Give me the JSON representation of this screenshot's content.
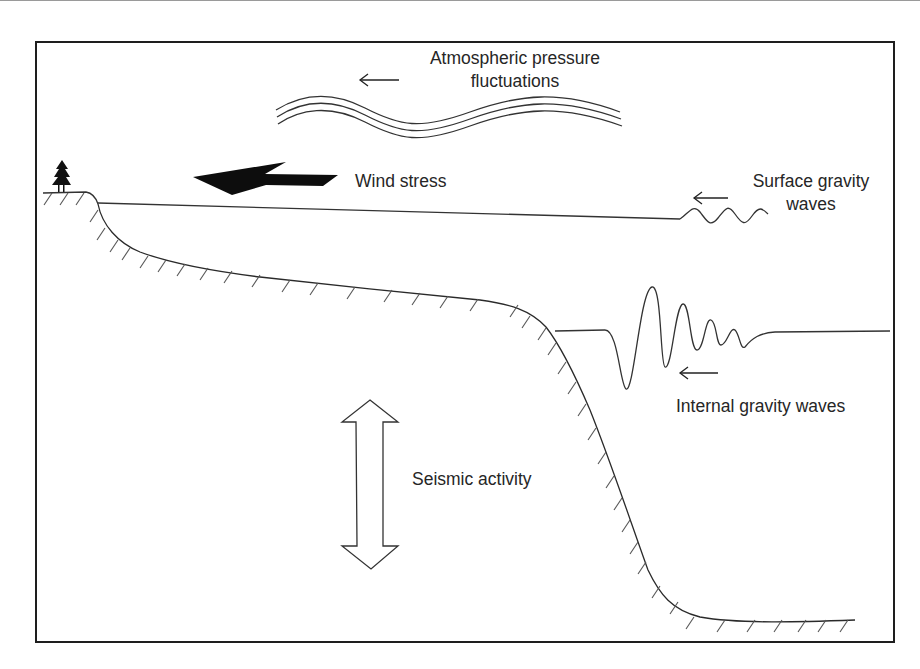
{
  "diagram": {
    "type": "ocean cross-section schematic of forcing mechanisms",
    "labels": {
      "atmospheric": [
        "Atmospheric pressure",
        "fluctuations"
      ],
      "wind": "Wind stress",
      "surface": [
        "Surface gravity",
        "waves"
      ],
      "internal": "Internal gravity waves",
      "seismic": "Seismic activity"
    },
    "icons": {
      "tree": "conifer-tree-icon",
      "wind_arrow": "filled-left-arrow",
      "seismic_arrow": "double-headed-vertical-arrow",
      "propagation_arrows": "thin-left-arrows"
    },
    "colors": {
      "ink": "#262626",
      "frame": "#1e1e1e",
      "background": "#ffffff"
    }
  }
}
